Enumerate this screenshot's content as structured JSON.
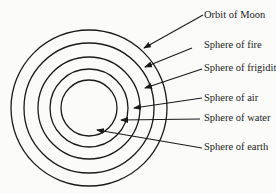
{
  "diagram": {
    "type": "concentric-spheres",
    "colors": {
      "stroke": "#1a1a1a",
      "text": "#222222",
      "background": "#fbfbfa"
    },
    "center": [
      89,
      108
    ],
    "circles": [
      {
        "name": "outer",
        "r": 78
      },
      {
        "name": "ring-2",
        "r": 65
      },
      {
        "name": "ring-3",
        "r": 51
      },
      {
        "name": "ring-4",
        "r": 39
      },
      {
        "name": "inner",
        "r": 28
      }
    ],
    "labels": [
      {
        "id": "orbit-of-moon",
        "text": "Orbit of Moon",
        "x": 204,
        "y": 10,
        "arrow_from": [
          203,
          15
        ],
        "arrow_to": [
          144,
          48
        ]
      },
      {
        "id": "sphere-of-fire",
        "text": "Sphere of fire",
        "x": 204,
        "y": 40,
        "arrow_from": [
          192,
          48
        ],
        "arrow_to": [
          145,
          67
        ]
      },
      {
        "id": "sphere-of-frigidity",
        "text": "Sphere of frigidity",
        "x": 204,
        "y": 63,
        "arrow_from": [
          202,
          69
        ],
        "arrow_to": [
          145,
          88
        ]
      },
      {
        "id": "sphere-of-air",
        "text": "Sphere of air",
        "x": 204,
        "y": 93,
        "arrow_from": [
          202,
          98
        ],
        "arrow_to": [
          134,
          108
        ]
      },
      {
        "id": "sphere-of-water",
        "text": "Sphere of water",
        "x": 204,
        "y": 113,
        "arrow_from": [
          200,
          119
        ],
        "arrow_to": [
          121,
          120
        ]
      },
      {
        "id": "sphere-of-earth",
        "text": "Sphere of earth",
        "x": 204,
        "y": 142,
        "arrow_from": [
          202,
          148
        ],
        "arrow_to": [
          97,
          130
        ]
      }
    ]
  }
}
